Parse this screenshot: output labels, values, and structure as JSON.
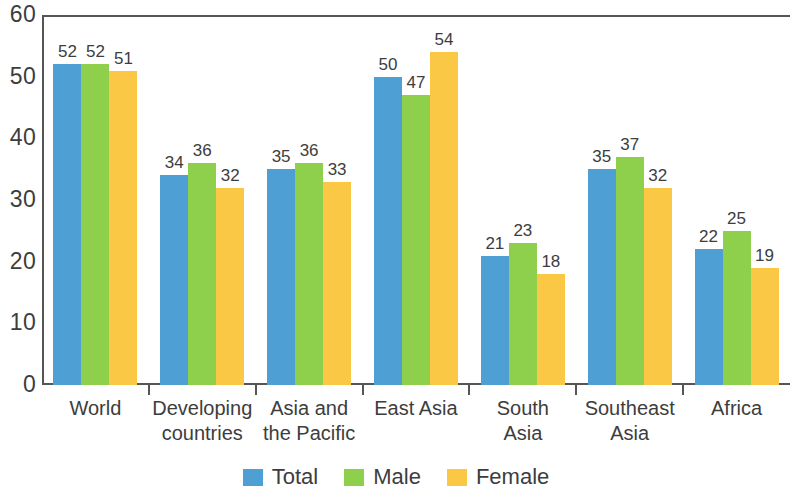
{
  "chart_data": {
    "type": "bar",
    "title": "",
    "subtitle": "",
    "xlabel": "",
    "ylabel": "",
    "ylim": [
      0,
      60
    ],
    "yticks": [
      0,
      10,
      20,
      30,
      40,
      50,
      60
    ],
    "grid": false,
    "legend_position": "bottom",
    "categories": [
      "World",
      "Developing countries",
      "Asia and the Pacific",
      "East Asia",
      "South Asia",
      "Southeast Asia",
      "Africa"
    ],
    "category_lines": [
      [
        "World"
      ],
      [
        "Developing",
        "countries"
      ],
      [
        "Asia and",
        "the Pacific"
      ],
      [
        "East Asia"
      ],
      [
        "South",
        "Asia"
      ],
      [
        "Southeast",
        "Asia"
      ],
      [
        "Africa"
      ]
    ],
    "series": [
      {
        "name": "Total",
        "color": "#4e9fd4",
        "values": [
          52,
          34,
          35,
          50,
          21,
          35,
          22
        ]
      },
      {
        "name": "Male",
        "color": "#8ed04c",
        "values": [
          52,
          36,
          36,
          47,
          23,
          37,
          25
        ]
      },
      {
        "name": "Female",
        "color": "#fbc846",
        "values": [
          51,
          32,
          33,
          54,
          18,
          32,
          19
        ]
      }
    ]
  },
  "axis": {
    "y_tick_labels": [
      "60",
      "50",
      "40",
      "30",
      "20",
      "10",
      "0"
    ]
  },
  "legend": {
    "items": [
      {
        "label": "Total",
        "color": "#4e9fd4"
      },
      {
        "label": "Male",
        "color": "#8ed04c"
      },
      {
        "label": "Female",
        "color": "#fbc846"
      }
    ]
  }
}
